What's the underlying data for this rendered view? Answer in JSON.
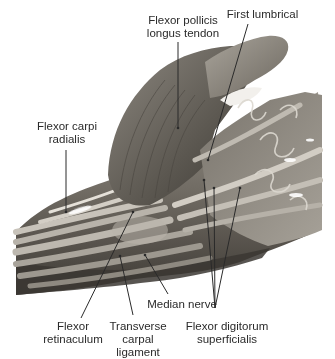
{
  "figure": {
    "colors": {
      "background": "#ffffff",
      "tissue_dark": "#4a4640",
      "tissue_mid": "#8a857d",
      "tissue_light": "#c9c4bb",
      "tendon": "#b5b0a7",
      "leader": "#2a2a2a",
      "text": "#2a2a2a"
    },
    "labels": [
      {
        "id": "flexor-pollicis-longus-tendon",
        "text": "Flexor pollicis\nlongus tendon"
      },
      {
        "id": "first-lumbrical",
        "text": "First lumbrical"
      },
      {
        "id": "flexor-carpi-radialis",
        "text": "Flexor carpi\nradialis"
      },
      {
        "id": "median-nerve",
        "text": "Median nerve"
      },
      {
        "id": "flexor-retinaculum",
        "text": "Flexor\nretinaculum"
      },
      {
        "id": "transverse-carpal-ligament",
        "text": "Transverse carpal\nligament"
      },
      {
        "id": "flexor-digitorum-superficialis",
        "text": "Flexor digitorum\nsuperficialis"
      }
    ]
  }
}
